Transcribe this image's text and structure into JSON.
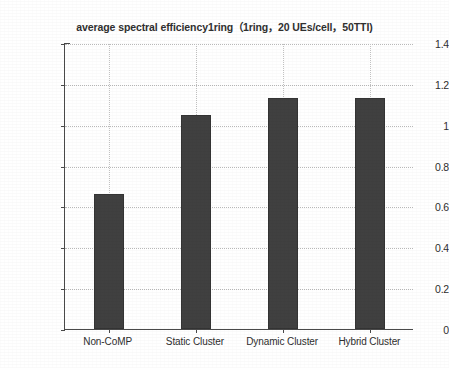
{
  "chart_data": {
    "type": "bar",
    "title": "average spectral efficiency1ring（1ring，20 UEs/cell，50TTI)",
    "xlabel": "",
    "ylabel": "average spectral efficiency (bit/cu)",
    "categories": [
      "Non-CoMP",
      "Static Cluster",
      "Dynamic Cluster",
      "Hybrid Cluster"
    ],
    "values": [
      0.66,
      1.05,
      1.13,
      1.13
    ],
    "ylim": [
      0,
      1.4
    ],
    "yticks": [
      0,
      0.2,
      0.4,
      0.6,
      0.8,
      1,
      1.2,
      1.4
    ],
    "ytick_labels": [
      "0",
      "0.2",
      "0.4",
      "0.6",
      "0.8",
      "1",
      "1.2",
      "1.4"
    ],
    "grid": true,
    "legend": null,
    "bar_color": "#404040",
    "axis_color": "#4a4a4a",
    "grid_color": "#b9b9b9",
    "background_color": "#ffffff"
  }
}
